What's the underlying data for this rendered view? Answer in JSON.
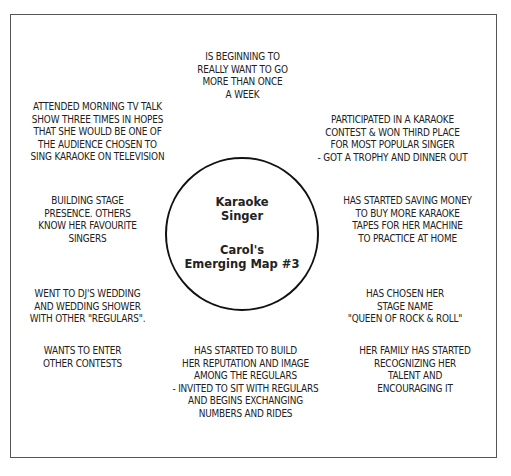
{
  "center": {
    "title": "Karaoke\nSinger",
    "subtitle": "Carol's\nEmerging Map #3"
  },
  "notes": {
    "top": "IS BEGINNING TO\nREALLY WANT TO GO\nMORE THAN ONCE\nA WEEK",
    "upper_left": "ATTENDED MORNING TV TALK\nSHOW THREE TIMES IN HOPES\nTHAT SHE WOULD BE ONE OF\nTHE AUDIENCE CHOSEN TO\nSING KARAOKE ON TELEVISION",
    "upper_right": "PARTICIPATED IN A KARAOKE\nCONTEST & WON THIRD PLACE\nFOR MOST POPULAR SINGER\n- GOT A TROPHY AND DINNER  OUT",
    "middle_left": "BUILDING STAGE\nPRESENCE. OTHERS\nKNOW HER FAVOURITE\nSINGERS",
    "middle_right": "HAS STARTED SAVING MONEY\nTO BUY MORE KARAOKE\nTAPES FOR HER MACHINE\nTO PRACTICE AT HOME",
    "lower_left": "WENT TO DJ'S WEDDING\nAND WEDDING SHOWER\nWITH OTHER \"REGULARS\".",
    "lower_right": "HAS CHOSEN HER\nSTAGE NAME\n\"QUEEN OF ROCK & ROLL\"",
    "bottom_left": "WANTS TO ENTER\nOTHER CONTESTS",
    "bottom_center": "HAS STARTED TO BUILD\nHER REPUTATION AND IMAGE\nAMONG THE REGULARS\n- INVITED TO SIT WITH REGULARS\nAND BEGINS EXCHANGING\nNUMBERS AND RIDES",
    "bottom_right": "HER FAMILY HAS STARTED\nRECOGNIZING HER\nTALENT AND\nENCOURAGING IT"
  }
}
